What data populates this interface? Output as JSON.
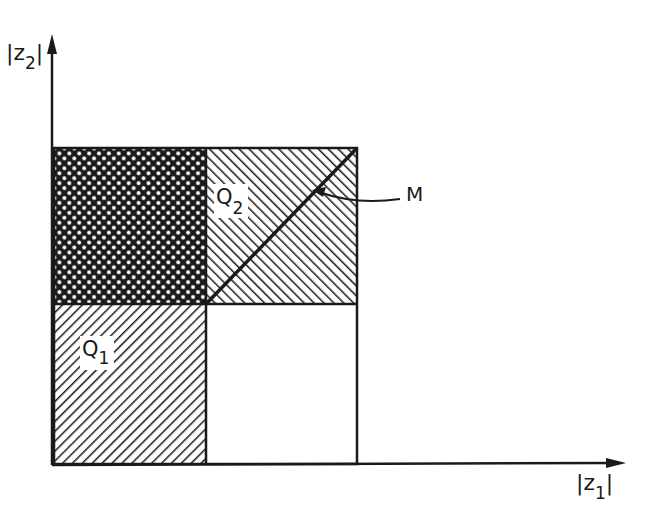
{
  "diagram": {
    "axes": {
      "y_label": "|z",
      "y_label_sub": "2",
      "y_label_close": "|",
      "x_label": "|z",
      "x_label_sub": "1",
      "x_label_close": "|"
    },
    "regions": [
      {
        "id": "Q1",
        "label": "Q",
        "sub": "1",
        "pattern": "diagonal hatch (down-right)"
      },
      {
        "id": "Q2",
        "label": "Q",
        "sub": "2",
        "pattern": "diagonal hatch (up-right)"
      },
      {
        "id": "Q1∩Q2",
        "pattern": "cross hatch"
      }
    ],
    "annotation": {
      "label": "M",
      "description": "diagonal line in Q2"
    },
    "colors": {
      "ink": "#1a1a1a",
      "background": "#ffffff"
    }
  }
}
